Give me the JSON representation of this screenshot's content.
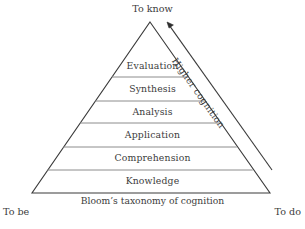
{
  "figure": {
    "caption": "Bloom’s taxonomy of cognition",
    "top_label": "To know",
    "bottom_left_label": "To be",
    "bottom_right_label": "To do",
    "arrow_label": "Higher cognition",
    "colors": {
      "background": "#ffffff",
      "outline": "#3a3a3a",
      "divider": "#8c8c8c",
      "text": "#3b3b3b",
      "arrow": "#3a3a3a"
    }
  },
  "pyramid": {
    "apex": {
      "x": 150,
      "y": 22
    },
    "base_left": {
      "x": 32,
      "y": 193
    },
    "base_right": {
      "x": 270,
      "y": 193
    },
    "tiers": [
      {
        "label": "Evaluation",
        "level": 6,
        "text_y": 66,
        "divider_y": 77
      },
      {
        "label": "Synthesis",
        "level": 5,
        "text_y": 89,
        "divider_y": 101
      },
      {
        "label": "Analysis",
        "level": 4,
        "text_y": 112,
        "divider_y": 123
      },
      {
        "label": "Application",
        "level": 3,
        "text_y": 135,
        "divider_y": 147
      },
      {
        "label": "Comprehension",
        "level": 2,
        "text_y": 158,
        "divider_y": 170
      },
      {
        "label": "Knowledge",
        "level": 1,
        "text_y": 181,
        "divider_y": 193
      }
    ]
  },
  "arrow": {
    "from": {
      "x": 272,
      "y": 170
    },
    "to": {
      "x": 167,
      "y": 23
    },
    "direction": "upward"
  }
}
